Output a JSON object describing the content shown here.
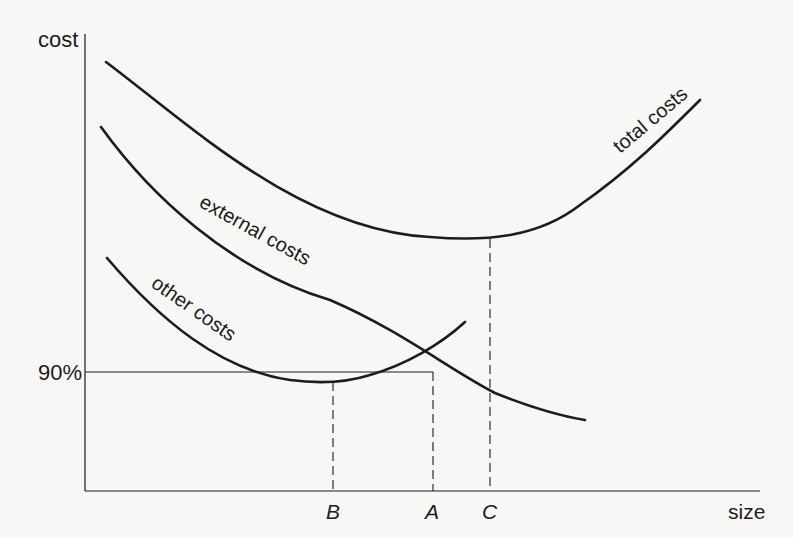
{
  "figure": {
    "type": "cost-size diagram",
    "axes": {
      "y_label": "cost",
      "x_label": "size",
      "y_reference": "90%"
    },
    "curves": [
      {
        "id": "total",
        "label": "total costs"
      },
      {
        "id": "external",
        "label": "external costs"
      },
      {
        "id": "other",
        "label": "other costs"
      }
    ],
    "markers": [
      {
        "id": "B",
        "label": "B",
        "meaning": "minimum of other costs"
      },
      {
        "id": "A",
        "label": "A",
        "meaning": "other costs reach 90% level"
      },
      {
        "id": "C",
        "label": "C",
        "meaning": "minimum of total costs"
      }
    ],
    "colors": {
      "ink": "#1c1c1c",
      "paper": "#f7f7f5"
    }
  }
}
